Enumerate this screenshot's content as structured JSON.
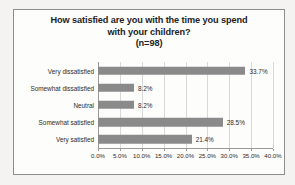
{
  "chart_data": {
    "type": "bar",
    "orientation": "horizontal",
    "title_lines": [
      "How satisfied are you with the time you spend",
      "with your children?",
      "(n=98)"
    ],
    "title": "How satisfied are you with the time you spend with your children? (n=98)",
    "sample_size": "(n=98)",
    "categories": [
      "Very dissatisfied",
      "Somewhat dissatisfied",
      "Neutral",
      "Somewhat satisfied",
      "Very satisfied"
    ],
    "values": [
      33.7,
      8.2,
      8.2,
      28.5,
      21.4
    ],
    "data_labels": [
      "33.7%",
      "8.2%",
      "8.2%",
      "28.5%",
      "21.4%"
    ],
    "xlabel": "",
    "ylabel": "",
    "xlim": [
      0,
      40
    ],
    "xticks": [
      0,
      5,
      10,
      15,
      20,
      25,
      30,
      35,
      40
    ],
    "xtick_labels": [
      "0.0%",
      "5.0%",
      "10.0%",
      "15.0%",
      "20.0%",
      "25.0%",
      "30.0%",
      "35.0%",
      "40.0%"
    ],
    "grid": true,
    "grid_axis": "x",
    "legend": false,
    "bar_color": "#8a8a8a",
    "grid_color": "#d8d8d8",
    "axis_color": "#9a9a9a",
    "text_color": "#2b2b2b",
    "plot_background": "#fdfdfc",
    "page_background": "#f4f3f1",
    "border_color": "#8d8d8d"
  }
}
